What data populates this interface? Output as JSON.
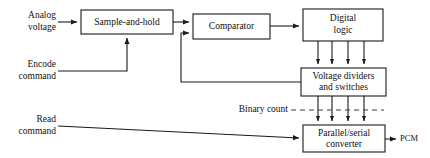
{
  "diagram": {
    "colors": {
      "line": "#1a1a1a",
      "dashed_line": "#3a3a3a",
      "box_fill": "#ffffff",
      "text": "#101010",
      "background": "#ffffff"
    },
    "blocks": [
      {
        "id": "sample-and-hold",
        "label_line1": "Sample-and-hold",
        "label_line2": "",
        "x": 81,
        "y": 10,
        "w": 92,
        "h": 24
      },
      {
        "id": "comparator",
        "label_line1": "Comparator",
        "label_line2": "",
        "x": 193,
        "y": 14,
        "w": 77,
        "h": 25
      },
      {
        "id": "digital-logic",
        "label_line1": "Digital",
        "label_line2": "logic",
        "x": 303,
        "y": 9,
        "w": 80,
        "h": 32
      },
      {
        "id": "voltage-dividers-and-switches",
        "label_line1": "Voltage dividers",
        "label_line2": "and switches",
        "x": 301,
        "y": 68,
        "w": 85,
        "h": 28
      },
      {
        "id": "parallel-serial-converter",
        "label_line1": "Parallel/serial",
        "label_line2": "converter",
        "x": 303,
        "y": 125,
        "w": 82,
        "h": 27
      }
    ],
    "input_labels": [
      {
        "id": "analog-voltage",
        "line1": "Analog",
        "line2": "voltage",
        "x": 56,
        "y": 22
      },
      {
        "id": "encode-command",
        "line1": "Encode",
        "line2": "command",
        "x": 56,
        "y": 71
      },
      {
        "id": "read-command",
        "line1": "Read",
        "line2": "command",
        "x": 56,
        "y": 126
      }
    ],
    "bus_label": {
      "id": "binary-count",
      "text": "Binary count",
      "x": 288,
      "y": 110
    },
    "output_label": {
      "id": "pcm-output",
      "text": "PCM",
      "x": 402,
      "y": 139
    },
    "bus_lines": {
      "count": 4,
      "x_positions": [
        318,
        332,
        348,
        364
      ]
    }
  }
}
